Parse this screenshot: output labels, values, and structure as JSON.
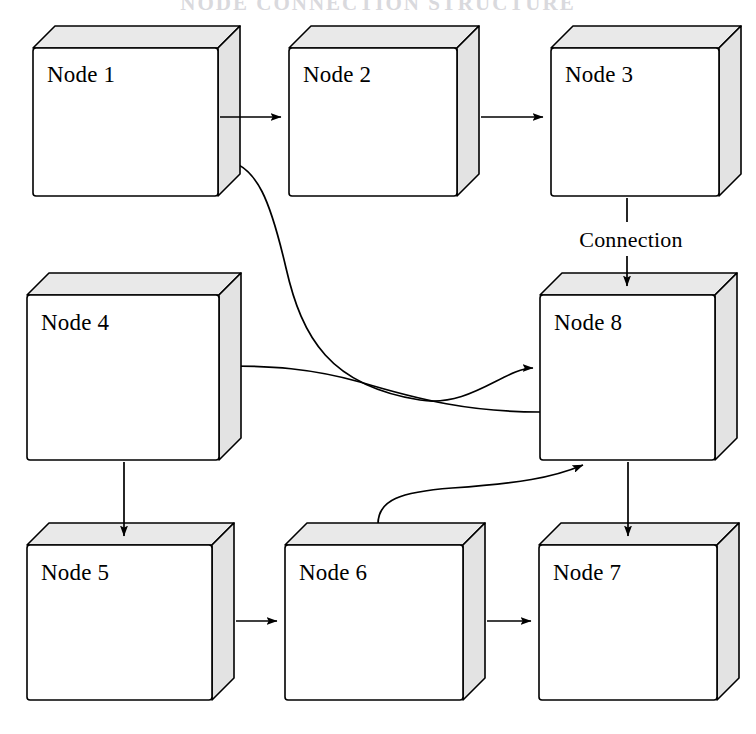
{
  "title": "NODE CONNECTION STRUCTURE",
  "diagram": {
    "type": "node-graph",
    "background_color": "#ffffff",
    "line_color": "#000000",
    "box_front_color": "#ffffff",
    "box_top_color": "#e9e9e9",
    "box_side_color": "#e3e3e3",
    "nodes": [
      {
        "id": "node1",
        "label": "Node 1",
        "x": 33,
        "y": 48,
        "w": 185,
        "h": 148,
        "depth": 22
      },
      {
        "id": "node2",
        "label": "Node 2",
        "x": 289,
        "y": 48,
        "w": 168,
        "h": 148,
        "depth": 22
      },
      {
        "id": "node3",
        "label": "Node 3",
        "x": 551,
        "y": 48,
        "w": 168,
        "h": 148,
        "depth": 22
      },
      {
        "id": "node4",
        "label": "Node 4",
        "x": 27,
        "y": 295,
        "w": 192,
        "h": 165,
        "depth": 22
      },
      {
        "id": "node8",
        "label": "Node 8",
        "x": 540,
        "y": 295,
        "w": 175,
        "h": 165,
        "depth": 22
      },
      {
        "id": "node5",
        "label": "Node 5",
        "x": 27,
        "y": 545,
        "w": 185,
        "h": 155,
        "depth": 22
      },
      {
        "id": "node6",
        "label": "Node 6",
        "x": 285,
        "y": 545,
        "w": 178,
        "h": 155,
        "depth": 22
      },
      {
        "id": "node7",
        "label": "Node 7",
        "x": 539,
        "y": 545,
        "w": 178,
        "h": 155,
        "depth": 22
      }
    ],
    "edges": [
      {
        "id": "edge-1-2",
        "from": "node1",
        "to": "node2",
        "shape": "straight",
        "direction": "right",
        "label": ""
      },
      {
        "id": "edge-2-3",
        "from": "node2",
        "to": "node3",
        "shape": "straight",
        "direction": "right",
        "label": ""
      },
      {
        "id": "edge-3-8",
        "from": "node3",
        "to": "node8",
        "shape": "straight",
        "direction": "down",
        "label": "Connection"
      },
      {
        "id": "edge-1-8",
        "from": "node1",
        "to": "node8",
        "shape": "curved",
        "direction": "right",
        "label": ""
      },
      {
        "id": "edge-8-4",
        "from": "node8",
        "to": "node4",
        "shape": "curved",
        "direction": "left",
        "label": ""
      },
      {
        "id": "edge-4-5",
        "from": "node4",
        "to": "node5",
        "shape": "straight",
        "direction": "down",
        "label": ""
      },
      {
        "id": "edge-5-6",
        "from": "node5",
        "to": "node6",
        "shape": "straight",
        "direction": "right",
        "label": ""
      },
      {
        "id": "edge-6-7",
        "from": "node6",
        "to": "node7",
        "shape": "straight",
        "direction": "right",
        "label": ""
      },
      {
        "id": "edge-6-8",
        "from": "node6",
        "to": "node8",
        "shape": "curved",
        "direction": "up-right",
        "label": ""
      },
      {
        "id": "edge-8-7",
        "from": "node8",
        "to": "node7",
        "shape": "straight",
        "direction": "down",
        "label": ""
      }
    ],
    "edge_labels": {
      "connection": "Connection"
    }
  }
}
